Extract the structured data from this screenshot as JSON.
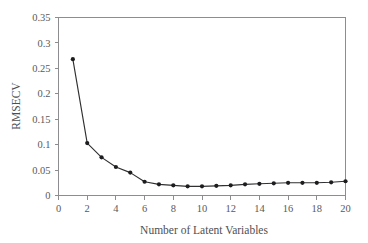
{
  "chart_data": {
    "type": "line",
    "title": "",
    "subtitle": "",
    "xlabel": "Number of Latent Variables",
    "ylabel": "RMSECV",
    "xlim": [
      0,
      20
    ],
    "ylim": [
      0,
      0.35
    ],
    "xticks": [
      0,
      2,
      4,
      6,
      8,
      10,
      12,
      14,
      16,
      18,
      20
    ],
    "xtick_labels": [
      "0",
      "2",
      "4",
      "6",
      "8",
      "10",
      "12",
      "14",
      "16",
      "18",
      "20"
    ],
    "yticks": [
      0,
      0.05,
      0.1,
      0.15,
      0.2,
      0.25,
      0.3,
      0.35
    ],
    "ytick_labels": [
      "0",
      "0.05",
      "0.1",
      "0.15",
      "0.2",
      "0.25",
      "0.3",
      "0.35"
    ],
    "grid": false,
    "legend": null,
    "annotations": [],
    "marker": "filled-circle",
    "line_color": "#303032",
    "marker_color": "#1d1d1f",
    "frame_color": "#8d8d8f",
    "background_color": "#ffffff",
    "x": [
      1,
      2,
      3,
      4,
      5,
      6,
      7,
      8,
      9,
      10,
      11,
      12,
      13,
      14,
      15,
      16,
      17,
      18,
      19,
      20
    ],
    "values": [
      0.268,
      0.103,
      0.075,
      0.056,
      0.045,
      0.027,
      0.022,
      0.02,
      0.018,
      0.018,
      0.019,
      0.02,
      0.022,
      0.023,
      0.024,
      0.025,
      0.025,
      0.025,
      0.026,
      0.028
    ],
    "series": [
      {
        "name": "RMSECV",
        "values": [
          0.268,
          0.103,
          0.075,
          0.056,
          0.045,
          0.027,
          0.022,
          0.02,
          0.018,
          0.018,
          0.019,
          0.02,
          0.022,
          0.023,
          0.024,
          0.025,
          0.025,
          0.025,
          0.026,
          0.028
        ]
      }
    ]
  }
}
